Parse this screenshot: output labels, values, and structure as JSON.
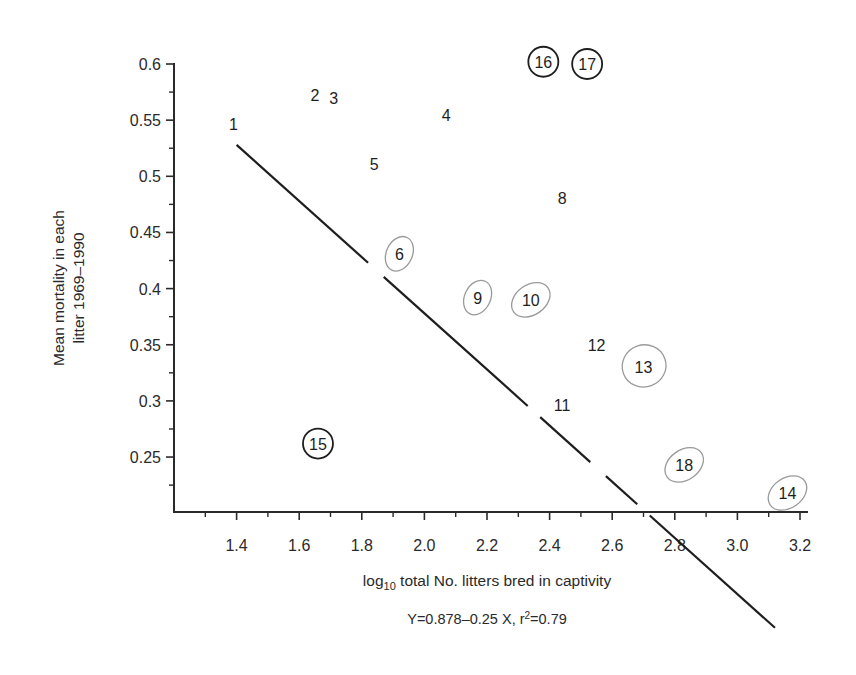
{
  "chart_data": {
    "type": "scatter",
    "title": "",
    "xlabel": "log10 total No. litters bred in captivity",
    "xlabel_parts": {
      "pre": "log",
      "sub": "10",
      "post": " total No. litters bred in captivity"
    },
    "ylabel_lines": [
      "Mean mortality in each",
      "litter 1969–1990"
    ],
    "ylabel": "Mean mortality in each litter 1969–1990",
    "caption": "Y=0.878–0.25 X, r²=0.79",
    "caption_parts": {
      "pre": "Y=0.878–0.25 X, r",
      "sup": "2",
      "post": "=0.79"
    },
    "xlim": [
      1.2,
      3.25
    ],
    "ylim": [
      0.2,
      0.6
    ],
    "x_ticks": [
      "1.4",
      "1.6",
      "1.8",
      "2.0",
      "2.2",
      "2.4",
      "2.6",
      "2.8",
      "3.0",
      "3.2"
    ],
    "x_tick_values": [
      1.4,
      1.6,
      1.8,
      2.0,
      2.2,
      2.4,
      2.6,
      2.8,
      3.0,
      3.2
    ],
    "x_minor_ticks": [
      1.3,
      1.5,
      1.7,
      1.9,
      2.1,
      2.3,
      2.5,
      2.7,
      2.9,
      3.1
    ],
    "y_ticks": [
      "0.6",
      "0.55",
      "0.5",
      "0.45",
      "0.4",
      "0.35",
      "0.3",
      "0.25"
    ],
    "y_tick_values": [
      0.6,
      0.55,
      0.5,
      0.45,
      0.4,
      0.35,
      0.3,
      0.25
    ],
    "y_minor_ticks": [
      0.575,
      0.525,
      0.475,
      0.425,
      0.375,
      0.325,
      0.275,
      0.225
    ],
    "grid": false,
    "legend": null,
    "regression": {
      "intercept": 0.878,
      "slope": -0.25,
      "r2": 0.79,
      "x_start": 1.4,
      "x_end": 3.12
    },
    "points": [
      {
        "label": "1",
        "x": 1.39,
        "y": 0.547,
        "marker": "none"
      },
      {
        "label": "2",
        "x": 1.65,
        "y": 0.572,
        "marker": "none"
      },
      {
        "label": "3",
        "x": 1.71,
        "y": 0.57,
        "marker": "none"
      },
      {
        "label": "4",
        "x": 2.07,
        "y": 0.555,
        "marker": "none"
      },
      {
        "label": "5",
        "x": 1.84,
        "y": 0.511,
        "marker": "none"
      },
      {
        "label": "6",
        "x": 1.92,
        "y": 0.431,
        "marker": "grey-ellipse"
      },
      {
        "label": "8",
        "x": 2.44,
        "y": 0.481,
        "marker": "none"
      },
      {
        "label": "9",
        "x": 2.17,
        "y": 0.392,
        "marker": "grey-ellipse"
      },
      {
        "label": "10",
        "x": 2.34,
        "y": 0.39,
        "marker": "grey-ellipse"
      },
      {
        "label": "11",
        "x": 2.44,
        "y": 0.296,
        "marker": "none"
      },
      {
        "label": "12",
        "x": 2.55,
        "y": 0.35,
        "marker": "none"
      },
      {
        "label": "13",
        "x": 2.7,
        "y": 0.33,
        "marker": "grey-circle"
      },
      {
        "label": "14",
        "x": 3.16,
        "y": 0.218,
        "marker": "grey-ellipse"
      },
      {
        "label": "15",
        "x": 1.66,
        "y": 0.262,
        "marker": "black-circle"
      },
      {
        "label": "16",
        "x": 2.38,
        "y": 0.602,
        "marker": "black-circle"
      },
      {
        "label": "17",
        "x": 2.52,
        "y": 0.6,
        "marker": "black-circle"
      },
      {
        "label": "18",
        "x": 2.83,
        "y": 0.243,
        "marker": "grey-ellipse"
      }
    ]
  },
  "colors": {
    "ink": "#1e1e1e",
    "axis": "#2a2a2a",
    "grey_ellipse": "#9a9a9a",
    "background": "#ffffff"
  }
}
